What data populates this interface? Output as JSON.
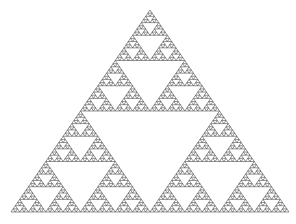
{
  "figure": {
    "type": "sierpinski-triangle",
    "width": 296,
    "height": 224,
    "background": "#ffffff",
    "stroke_color": "#3a3a3a",
    "stroke_width": 0.55,
    "depth": 6,
    "vertices": {
      "apex": [
        150,
        10
      ],
      "bottom_left": [
        11,
        212
      ],
      "bottom_right": [
        289,
        212
      ]
    }
  }
}
